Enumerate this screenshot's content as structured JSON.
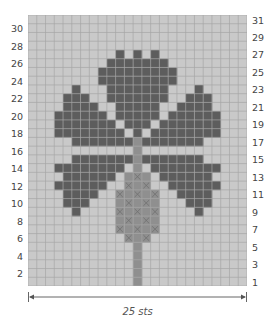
{
  "chart_data": {
    "type": "heatmap",
    "title": "",
    "subtitle": "Knitting colorwork chart (thistle motif)",
    "columns": 25,
    "rows": 31,
    "xlabel": "25 sts",
    "ylabel": "",
    "left_row_labels": [
      2,
      4,
      6,
      8,
      10,
      12,
      14,
      16,
      18,
      20,
      22,
      24,
      26,
      28,
      30
    ],
    "right_row_labels": [
      1,
      3,
      5,
      7,
      9,
      11,
      13,
      15,
      17,
      19,
      21,
      23,
      25,
      27,
      29,
      31
    ],
    "legend": {
      "0": "background (light gray)",
      "1": "contrast color (dark gray)",
      "2": "stem color (medium gray)",
      "3": "thistle head (medium gray, crossed)"
    },
    "colors": {
      "background": "#c9c9c9",
      "gridline": "#a6a6a6",
      "dark": "#5d5d5d",
      "medium": "#8f8f8f",
      "cross": "#6e6e6e"
    },
    "grid_rows_top_to_bottom": {
      "31": "0000000000000000000000000",
      "30": "0000000000000000000000000",
      "29": "0000000000000000000000000",
      "28": "0000000000000000000000000",
      "27": "0000000000101010000000000",
      "26": "0000000001111111000000000",
      "25": "0000000011111111100000000",
      "24": "0000000011111111100000000",
      "23": "0000010001111111000100000",
      "22": "0000111001111111001110000",
      "21": "0000111100111110011110000",
      "20": "0001111110111110111111000",
      "19": "0001111111011101111111000",
      "18": "0001111111101011111111000",
      "17": "0000011111112111111100000",
      "16": "0000000000002000000000000",
      "15": "0000011111112111111100000",
      "14": "0001111111102011111111000",
      "13": "0000111111033301111110000",
      "12": "0001111110033300111111000",
      "11": "0000111100333330011110000",
      "10": "0000111000333330001110000",
      "9": "0000010000333330000100000",
      "8": "0000000000333330000000000",
      "7": "0000000000333330000000000",
      "6": "0000000000033300000000000",
      "5": "0000000000002000000000000",
      "4": "0000000000002000000000000",
      "3": "0000000000002000000000000",
      "2": "0000000000002000000000000",
      "1": "0000000000002000000000000"
    }
  },
  "dimension": {
    "label": "25 sts"
  }
}
